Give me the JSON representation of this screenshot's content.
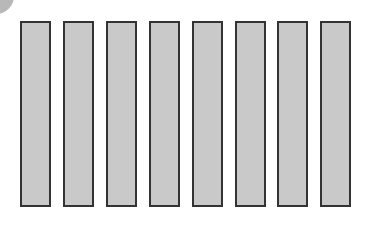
{
  "colors": {
    "bar_fill": "#c9c9c9",
    "bar_border": "#333333",
    "corner": "#b8b8b8",
    "background": "#ffffff"
  },
  "bars": [
    {
      "id": 1
    },
    {
      "id": 2
    },
    {
      "id": 3
    },
    {
      "id": 4
    },
    {
      "id": 5
    },
    {
      "id": 6
    },
    {
      "id": 7
    },
    {
      "id": 8
    }
  ]
}
